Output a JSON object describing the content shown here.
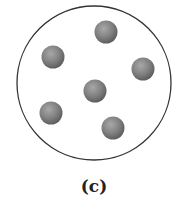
{
  "diagram": {
    "label": "(c)",
    "container": {
      "shape": "circle",
      "cx": 94,
      "cy": 83,
      "r": 77,
      "stroke": "#333333"
    },
    "particles": [
      {
        "cx": 106,
        "cy": 32
      },
      {
        "cx": 53,
        "cy": 57
      },
      {
        "cx": 143,
        "cy": 69
      },
      {
        "cx": 95,
        "cy": 91
      },
      {
        "cx": 51,
        "cy": 113
      },
      {
        "cx": 113,
        "cy": 128
      }
    ],
    "particle_radius": 11.5,
    "particle_color": "#7a7a7a"
  }
}
